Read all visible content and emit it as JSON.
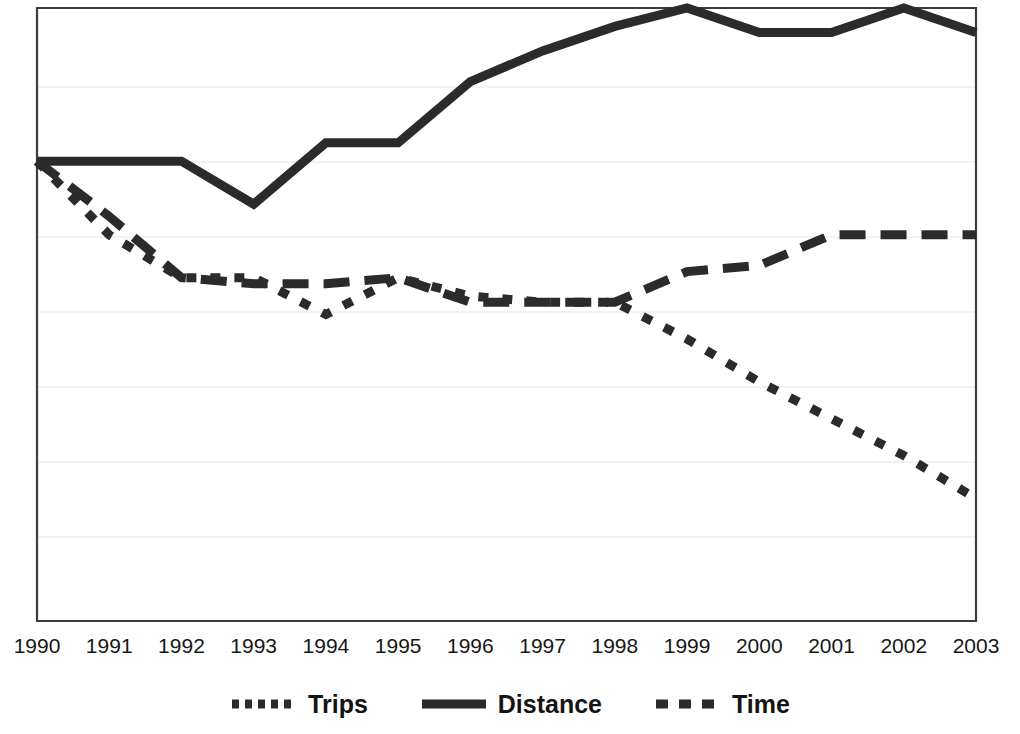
{
  "chart_data": {
    "type": "line",
    "title": "",
    "subtitle": "",
    "xlabel": "",
    "ylabel": "",
    "grid": true,
    "legend_position": "bottom",
    "x": [
      1990,
      1991,
      1992,
      1993,
      1994,
      1995,
      1996,
      1997,
      1998,
      1999,
      2000,
      2001,
      2002,
      2003
    ],
    "categories": [
      "1990",
      "1991",
      "1992",
      "1993",
      "1994",
      "1995",
      "1996",
      "1997",
      "1998",
      "1999",
      "2000",
      "2001",
      "2002",
      "2003"
    ],
    "xlim": [
      1990,
      2003
    ],
    "ylim": [
      0,
      100
    ],
    "yticks": [],
    "gridline_count": 8,
    "series": [
      {
        "name": "Trips",
        "style": "dotted",
        "color": "#2b2b2b",
        "values": [
          75,
          63,
          56,
          56,
          50,
          56,
          53,
          52,
          52,
          46,
          39,
          33,
          27,
          20
        ]
      },
      {
        "name": "Distance",
        "style": "solid",
        "color": "#2b2b2b",
        "values": [
          75,
          75,
          75,
          68,
          78,
          78,
          88,
          93,
          97,
          100,
          96,
          96,
          100,
          96
        ]
      },
      {
        "name": "Time",
        "style": "dashed",
        "color": "#2b2b2b",
        "values": [
          75,
          66,
          56,
          55,
          55,
          56,
          52,
          52,
          52,
          57,
          58,
          63,
          63,
          63
        ]
      }
    ]
  },
  "axis": {
    "x_tick_labels": [
      "1990",
      "1991",
      "1992",
      "1993",
      "1994",
      "1995",
      "1996",
      "1997",
      "1998",
      "1999",
      "2000",
      "2001",
      "2002",
      "2003"
    ]
  },
  "legend": {
    "items": [
      {
        "label": "Trips",
        "swatch": "dotted-line-swatch"
      },
      {
        "label": "Distance",
        "swatch": "solid-line-swatch"
      },
      {
        "label": "Time",
        "swatch": "dashed-line-swatch"
      }
    ]
  },
  "style": {
    "line_color": "#2b2b2b",
    "axis_color": "#3a3a3a",
    "grid_color": "#eeeeee",
    "background": "#ffffff",
    "text_color": "#171717"
  }
}
